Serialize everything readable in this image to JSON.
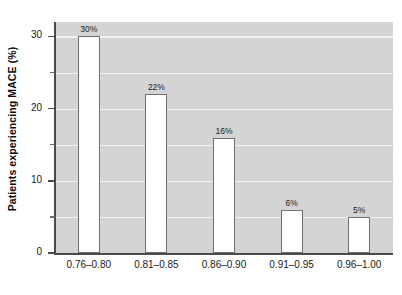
{
  "chart_data": {
    "type": "bar",
    "title": "",
    "xlabel": "",
    "ylabel": "Patients experiencing MACE (%)",
    "categories": [
      "0.76–0.80",
      "0.81–0.85",
      "0.86–0.90",
      "0.91–0.95",
      "0.96–1.00"
    ],
    "values": [
      30,
      22,
      16,
      6,
      5
    ],
    "data_labels": [
      "30%",
      "22%",
      "16%",
      "6%",
      "5%"
    ],
    "ylim": [
      0,
      32
    ],
    "y_ticks_major": [
      0,
      10,
      20,
      30
    ],
    "y_tick_labels": [
      "0",
      "10",
      "20",
      "30"
    ],
    "y_ticks_minor": [
      5,
      15,
      25
    ],
    "gridlines": [
      5,
      10,
      15,
      20,
      25,
      30
    ],
    "grid": true,
    "legend": "none",
    "colors": {
      "plot_background": "#d4d4d4",
      "gridline": "#f2f2f2",
      "bar_fill": "#ffffff",
      "bar_edge": "#6e6e6e",
      "axis": "#4a4a4a",
      "text": "#1a1a1a"
    }
  }
}
